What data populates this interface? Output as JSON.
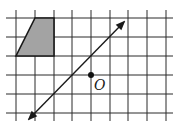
{
  "diagram": {
    "type": "grid-geometry",
    "grid": {
      "columns_x": [
        16,
        35,
        54,
        72,
        91,
        110,
        128,
        147,
        166
      ],
      "rows_y": [
        18,
        37,
        56,
        75,
        94,
        113
      ],
      "line_color": "#2a2a2a"
    },
    "shape": {
      "kind": "trapezoid",
      "fill": "#a3a3a3",
      "stroke": "#1a1a1a",
      "vertices": [
        [
          35,
          18
        ],
        [
          54,
          18
        ],
        [
          54,
          56
        ],
        [
          16,
          56
        ]
      ]
    },
    "axis_line": {
      "kind": "line-with-arrows",
      "from": [
        29,
        119
      ],
      "to": [
        124,
        22
      ],
      "color": "#1a1a1a"
    },
    "point": {
      "label": "O",
      "x": 91,
      "y": 75,
      "color": "#111111"
    }
  }
}
